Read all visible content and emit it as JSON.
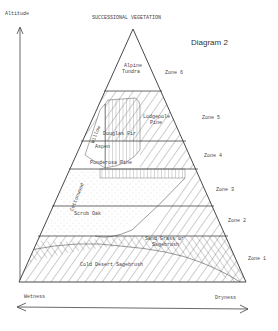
{
  "title": "SUCCESSIONAL VEGETATION",
  "diagram_label": "Diagram 2",
  "axes": {
    "vertical": "Altitude",
    "horizontal_left": "Wetness",
    "horizontal_right": "Dryness"
  },
  "zones": [
    {
      "name": "Zone 6",
      "vegetation": [
        "Alpine Tundra"
      ]
    },
    {
      "name": "Zone 5",
      "vegetation": [
        "Lodgepole Pine",
        "Douglas Fir"
      ]
    },
    {
      "name": "Zone 4",
      "vegetation": [
        "Aspen",
        "Ponderosa Pine",
        "Willow"
      ]
    },
    {
      "name": "Zone 3",
      "vegetation": [
        "Cottonwood"
      ]
    },
    {
      "name": "Zone 2",
      "vegetation": [
        "Scrub Oak"
      ]
    },
    {
      "name": "Zone 1",
      "vegetation": [
        "Sand Grass or Sagebrush",
        "Cold Desert Sagebrush"
      ]
    }
  ],
  "labels": {
    "alpine_tundra_1": "Alpine",
    "alpine_tundra_2": "Tundra",
    "lodgepole_1": "Lodgepole",
    "lodgepole_2": "Pine",
    "douglas_fir": "Douglas Fir",
    "willow": "Willow",
    "aspen": "Aspen",
    "ponderosa": "Ponderosa Pine",
    "cottonwood": "Cottonwood",
    "scrub_oak": "Scrub Oak",
    "sand_grass_1": "Sand Grass or",
    "sand_grass_2": "Sagebrush",
    "cold_desert": "Cold Desert Sagebrush"
  }
}
